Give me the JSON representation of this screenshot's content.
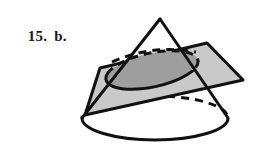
{
  "figure": {
    "label_number": "15.",
    "label_letter": "b.",
    "caption_full": "15.  b.",
    "type": "geometry-diagram",
    "background_color": "#ffffff",
    "stroke_color": "#111111",
    "plane_fill_color": "#c9c9c9",
    "cross_section_fill_color": "#9e9e9e",
    "cone_fill_color": "#ffffff",
    "shapes": {
      "cone": {
        "name": "cone",
        "apex": [
          160,
          19
        ],
        "base_center": [
          155,
          118
        ],
        "base_rx": 73,
        "base_ry": 22,
        "front_arc_style": "solid",
        "back_arc_style": "dashed",
        "left_slant_from": [
          160,
          19
        ],
        "left_slant_to": [
          82,
          118
        ],
        "right_slant_from": [
          160,
          19
        ],
        "right_slant_to": [
          228,
          118
        ]
      },
      "plane": {
        "name": "cutting-plane",
        "vertices": [
          [
            100,
            68
          ],
          [
            207,
            43
          ],
          [
            243,
            80
          ],
          [
            85,
            115
          ]
        ],
        "fill": "#c9c9c9",
        "opacity": "translucent"
      },
      "cross_section": {
        "name": "elliptical-cross-section",
        "center": [
          152,
          70
        ],
        "rx": 47,
        "ry": 17,
        "rotation_deg": -12,
        "front_arc_style": "solid",
        "back_arc_style": "dashed",
        "fill": "#9e9e9e"
      }
    }
  }
}
